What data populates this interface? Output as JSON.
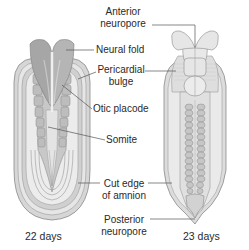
{
  "labels": {
    "anterior_neuropore": [
      "Anterior",
      "neuropore"
    ],
    "neural_fold": "Neural fold",
    "pericardial_bulge": [
      "Pericardial",
      "bulge"
    ],
    "otic_placode": "Otic placode",
    "somite": "Somite",
    "cut_edge_of_amnion": [
      "Cut edge",
      "of amnion"
    ],
    "posterior_neuropore": [
      "Posterior",
      "neuropore"
    ]
  },
  "captions": {
    "left": "22 days",
    "right": "23 days"
  },
  "colors": {
    "background": "#ffffff",
    "text": "#2a2a2a",
    "leader_line": "#555555",
    "tissue_dark": "#9a9a9a",
    "tissue_mid": "#c4c4c4",
    "tissue_light": "#e2e2e2",
    "outline": "#8a8a8a"
  }
}
